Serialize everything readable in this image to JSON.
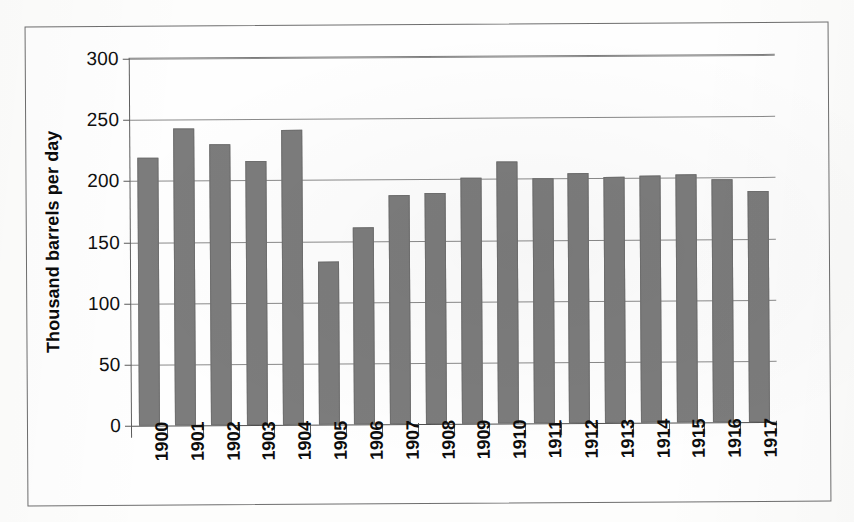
{
  "chart_data": {
    "type": "bar",
    "title": "",
    "subtitle": "",
    "xlabel": "",
    "ylabel": "Thousand barrels per day",
    "categories": [
      "1900",
      "1901",
      "1902",
      "1903",
      "1904",
      "1905",
      "1906",
      "1907",
      "1908",
      "1909",
      "1910",
      "1911",
      "1912",
      "1913",
      "1914",
      "1915",
      "1916",
      "1917"
    ],
    "values": [
      219,
      243,
      230,
      216,
      241,
      133,
      161,
      187,
      189,
      201,
      214,
      200,
      204,
      201,
      202,
      203,
      199,
      189
    ],
    "series": [
      {
        "name": "Thousand barrels per day",
        "values": [
          219,
          243,
          230,
          216,
          241,
          133,
          161,
          187,
          189,
          201,
          214,
          200,
          204,
          201,
          202,
          203,
          199,
          189
        ]
      }
    ],
    "ylim": [
      0,
      300
    ],
    "ytick_values": [
      0,
      50,
      100,
      150,
      200,
      250,
      300
    ],
    "ytick_labels": [
      "0",
      "50",
      "100",
      "150",
      "200",
      "250",
      "300"
    ],
    "grid": true,
    "grid_axis": "y",
    "legend": false,
    "legend_position": "none",
    "bar_color": "#7c7c7c",
    "gridline_color": "#8a8a8a",
    "axis_color": "#4f4f4f",
    "background_color": "#fefefe",
    "text_color": "#0d0d0d",
    "xtick_label_rotation": 90
  },
  "figure": {
    "frame_border_color": "#6e6e6e",
    "page_background": "#fdfdfc"
  }
}
